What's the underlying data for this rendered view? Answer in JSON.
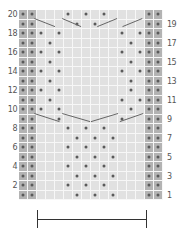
{
  "chart": {
    "columns": 16,
    "rows": 20,
    "edge_columns": [
      0,
      1,
      14,
      15
    ],
    "colors": {
      "background_cell": "#e1e1e1",
      "edge_cell": "#b3b3b3",
      "dot": "#5a5a5a",
      "grid_line": "#f7f7f7",
      "decrease_line": "#666666"
    },
    "left_row_labels": [
      "20",
      "18",
      "16",
      "14",
      "12",
      "10",
      "8",
      "6",
      "4",
      "2"
    ],
    "right_row_labels": [
      "19",
      "17",
      "15",
      "13",
      "11",
      "9",
      "7",
      "5",
      "3",
      "1"
    ],
    "dots": {
      "20": [
        5,
        7,
        9
      ],
      "19": [
        6,
        8
      ],
      "18": [
        2,
        4,
        11,
        13
      ],
      "17": [
        3,
        12
      ],
      "16": [
        2,
        4,
        11,
        13
      ],
      "15": [
        3,
        12
      ],
      "14": [
        2,
        4,
        11,
        13
      ],
      "13": [
        3,
        12
      ],
      "12": [
        2,
        4,
        12
      ],
      "11": [
        3,
        11,
        13
      ],
      "10": [
        2,
        4,
        12
      ],
      "9": [
        4,
        11
      ],
      "8": [
        5,
        7,
        9
      ],
      "7": [
        6,
        8,
        10
      ],
      "6": [
        5,
        7,
        9
      ],
      "5": [
        6,
        8,
        10
      ],
      "4": [
        5,
        7,
        9
      ],
      "3": [
        6,
        8,
        10
      ],
      "2": [
        5,
        7,
        9
      ],
      "1": [
        6,
        8,
        10
      ]
    },
    "decrease_lines": [
      {
        "row": 19,
        "from_col": 1.7,
        "to_col": 4.0,
        "dir": "down"
      },
      {
        "row": 19,
        "from_col": 4.8,
        "to_col": 6.9,
        "dir": "down"
      },
      {
        "row": 19,
        "from_col": 8.7,
        "to_col": 10.9,
        "dir": "up"
      },
      {
        "row": 19,
        "from_col": 11.5,
        "to_col": 13.7,
        "dir": "up"
      },
      {
        "row": 9,
        "from_col": 1.7,
        "to_col": 4.5,
        "dir": "down"
      },
      {
        "row": 9,
        "from_col": 4.8,
        "to_col": 7.9,
        "dir": "down"
      },
      {
        "row": 9,
        "from_col": 8.0,
        "to_col": 11.0,
        "dir": "up"
      },
      {
        "row": 9,
        "from_col": 11.2,
        "to_col": 13.8,
        "dir": "up"
      }
    ]
  },
  "scale_bar": {
    "label": "pattern repeat"
  }
}
